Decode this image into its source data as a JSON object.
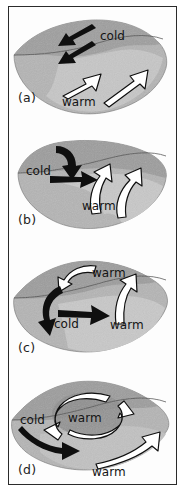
{
  "figure": {
    "title": "",
    "panel_count": 4,
    "background_color": "#ffffff",
    "frame_color": "#2b2b2b",
    "blob_fill_light": "#c9c9c9",
    "blob_fill_mid": "#a9a9a9",
    "blob_fill_dark": "#8f8f8f",
    "cold_arrow_color": "#101010",
    "warm_arrow_color": "#ffffff",
    "warm_arrow_outline": "#101010"
  },
  "panels": [
    {
      "id": "panel-a",
      "label": "(a)",
      "labels": [
        {
          "text": "cold",
          "kind": "cold",
          "x": 113,
          "y": 32
        },
        {
          "text": "warm",
          "kind": "warm",
          "x": 84,
          "y": 94
        }
      ],
      "cold_arrows": 2,
      "warm_arrows": 2,
      "description": "Lens-shaped section with two straight black arrows pointing down-left and two open white arrows pointing up-right"
    },
    {
      "id": "panel-b",
      "label": "(b)",
      "labels": [
        {
          "text": "cold",
          "kind": "cold",
          "x": 48,
          "y": 172
        },
        {
          "text": "warm",
          "kind": "warm",
          "x": 103,
          "y": 205
        }
      ],
      "cold_arrows": 2,
      "warm_arrows": 2,
      "description": "One curved black arrow descending and one straight black arrow to the right; two curved open white arrows rising"
    },
    {
      "id": "panel-c",
      "label": "(c)",
      "labels": [
        {
          "text": "warm",
          "kind": "warm",
          "x": 110,
          "y": 272
        },
        {
          "text": "cold",
          "kind": "cold",
          "x": 68,
          "y": 322
        },
        {
          "text": "warm",
          "kind": "warm",
          "x": 128,
          "y": 323
        }
      ],
      "cold_arrows": 2,
      "warm_arrows": 2,
      "description": "White arrow curving down-left at top, curved black arrow descending, straight black arrow right, vertical white arrow on right"
    },
    {
      "id": "panel-d",
      "label": "(d)",
      "labels": [
        {
          "text": "cold",
          "kind": "cold",
          "x": 37,
          "y": 421
        },
        {
          "text": "warm",
          "kind": "warm",
          "x": 88,
          "y": 420
        },
        {
          "text": "warm",
          "kind": "warm",
          "x": 113,
          "y": 472
        }
      ],
      "cold_arrows": 1,
      "warm_arrows": 3,
      "description": "Two curved open white arrows forming a closed circulation around the warm label, a curved black arrow below-left, and a white arrow to the lower right"
    }
  ]
}
